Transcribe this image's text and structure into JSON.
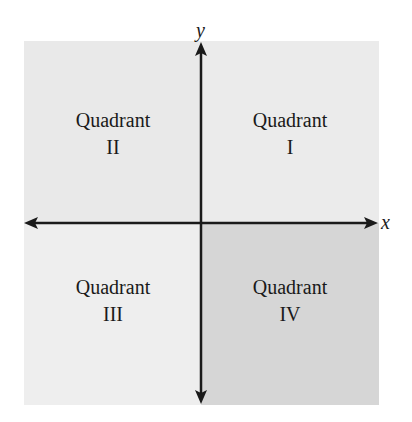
{
  "diagram": {
    "axes": {
      "x_label": "x",
      "y_label": "y",
      "color": "#1a1a1a"
    },
    "quadrants": [
      {
        "id": "I",
        "word": "Quadrant",
        "numeral": "I",
        "fill": "#ebebeb"
      },
      {
        "id": "II",
        "word": "Quadrant",
        "numeral": "II",
        "fill": "#e9e9e9"
      },
      {
        "id": "III",
        "word": "Quadrant",
        "numeral": "III",
        "fill": "#eeeeee"
      },
      {
        "id": "IV",
        "word": "Quadrant",
        "numeral": "IV",
        "fill": "#d6d6d6"
      }
    ]
  }
}
